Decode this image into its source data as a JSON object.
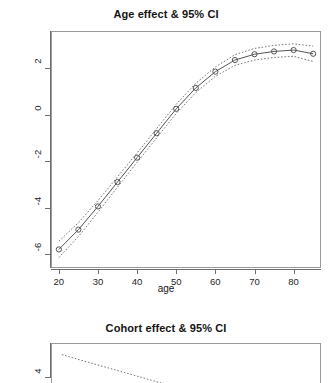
{
  "figure": {
    "background": "#ffffff",
    "line_color": "#555555",
    "ci_color": "#777777",
    "frame_color": "#9a9a9a"
  },
  "panels": [
    {
      "id": "age",
      "title": "Age effect & 95% CI"
    },
    {
      "id": "cohort",
      "title": "Cohort effect & 95% CI"
    }
  ],
  "chart_data": [
    {
      "type": "line",
      "title": "Age effect & 95% CI",
      "xlabel": "age",
      "ylabel": "",
      "xlim": [
        18,
        87
      ],
      "ylim": [
        -6.6,
        3.6
      ],
      "xticks": [
        20,
        30,
        40,
        50,
        60,
        70,
        80
      ],
      "yticks": [
        2,
        0,
        -2,
        -4,
        -6
      ],
      "grid": false,
      "legend": null,
      "marker": "circle",
      "x": [
        20,
        25,
        30,
        35,
        40,
        45,
        50,
        55,
        60,
        65,
        70,
        75,
        80,
        85
      ],
      "series": [
        {
          "name": "estimate",
          "style": "solid-with-points",
          "values": [
            -5.8,
            -4.95,
            -3.95,
            -2.9,
            -1.85,
            -0.8,
            0.25,
            1.15,
            1.85,
            2.35,
            2.6,
            2.72,
            2.78,
            2.62
          ]
        },
        {
          "name": "upper 95% CI",
          "style": "dotted",
          "values": [
            -5.45,
            -4.65,
            -3.7,
            -2.68,
            -1.65,
            -0.6,
            0.45,
            1.35,
            2.05,
            2.58,
            2.85,
            2.98,
            3.05,
            2.95
          ]
        },
        {
          "name": "lower 95% CI",
          "style": "dotted",
          "values": [
            -6.15,
            -5.25,
            -4.2,
            -3.12,
            -2.05,
            -1.0,
            0.05,
            0.95,
            1.65,
            2.12,
            2.35,
            2.46,
            2.51,
            2.29
          ]
        }
      ]
    },
    {
      "type": "line",
      "title": "Cohort effect & 95% CI",
      "xlabel": "",
      "ylabel": "",
      "xlim": [
        0,
        100
      ],
      "ylim": [
        2.4,
        5.6
      ],
      "xticks": [],
      "yticks": [
        4
      ],
      "grid": false,
      "legend": null,
      "marker": "none",
      "note": "panel cropped at bottom of screenshot",
      "x": [
        4,
        10,
        16,
        22,
        28,
        34,
        40,
        46,
        52
      ],
      "series": [
        {
          "name": "upper 95% CI",
          "style": "dotted",
          "values": [
            5.05,
            4.82,
            4.6,
            4.38,
            4.16,
            3.94,
            3.72,
            3.5,
            3.28
          ]
        }
      ]
    }
  ]
}
